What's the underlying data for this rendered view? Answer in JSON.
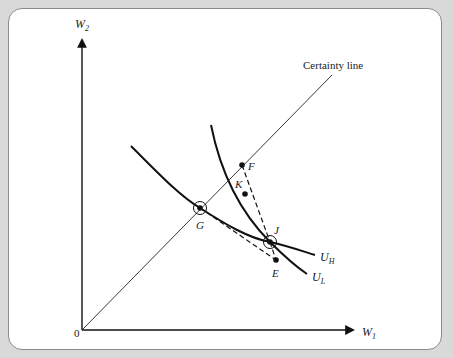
{
  "diagram": {
    "title": "",
    "axes": {
      "x_label": "W",
      "x_label_sub": "1",
      "y_label": "W",
      "y_label_sub": "2",
      "origin_label": "0"
    },
    "lines": {
      "certainty_line_label": "Certainty line"
    },
    "curves": [
      {
        "name": "U_H",
        "label": "U",
        "sub": "H"
      },
      {
        "name": "U_L",
        "label": "U",
        "sub": "L"
      }
    ],
    "points": [
      {
        "name": "F",
        "label": "F",
        "circled": false
      },
      {
        "name": "K",
        "label": "K",
        "circled": false
      },
      {
        "name": "G",
        "label": "G",
        "circled": true
      },
      {
        "name": "J",
        "label": "J",
        "circled": true
      },
      {
        "name": "E",
        "label": "E",
        "circled": false
      }
    ],
    "dashed_segments": [
      {
        "from": "F",
        "to": "J"
      },
      {
        "from": "G",
        "to": "E"
      }
    ],
    "colors": {
      "background": "#d9d9d9",
      "panel": "#ffffff",
      "ink": "#111111",
      "border": "#8a8a8a"
    }
  }
}
